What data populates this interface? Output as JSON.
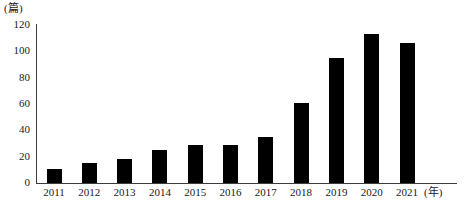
{
  "chart_data": {
    "type": "bar",
    "title": "",
    "subtitle": "",
    "xlabel": "(年)",
    "ylabel": "(篇)",
    "categories": [
      "2011",
      "2012",
      "2013",
      "2014",
      "2015",
      "2016",
      "2017",
      "2018",
      "2019",
      "2020",
      "2021"
    ],
    "values": [
      11,
      15,
      18,
      25,
      29,
      29,
      35,
      61,
      95,
      113,
      106
    ],
    "ylim": [
      0,
      120
    ],
    "yticks": [
      0,
      20,
      40,
      60,
      80,
      100,
      120
    ],
    "ytick_labels": [
      "0",
      "20",
      "40",
      "60",
      "80",
      "100",
      "120"
    ],
    "grid": false,
    "legend": null,
    "bar_color": "#000000",
    "axis_color": "#3d3d3d"
  },
  "axes": {
    "y_unit_label": "(篇)",
    "x_unit_label": "(年)"
  },
  "caption": {
    "text": ""
  }
}
